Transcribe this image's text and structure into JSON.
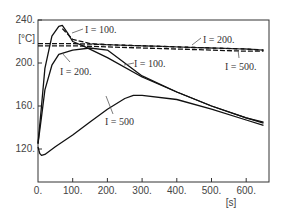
{
  "chart_data": {
    "type": "line",
    "title": "",
    "xlabel": "[s]",
    "ylabel": "[°C]",
    "xlim": [
      0,
      665
    ],
    "ylim": [
      108,
      240
    ],
    "x_ticks": [
      "0.",
      "100.",
      "200.",
      "300.",
      "400.",
      "500.",
      "600."
    ],
    "y_ticks": [
      "240.",
      "200.",
      "160.",
      "120."
    ],
    "grid": false,
    "legend": "inline annotations",
    "series": [
      {
        "name": "I = 100.",
        "style": "solid",
        "x": [
          0,
          10,
          20,
          40,
          60,
          70,
          85,
          100,
          130,
          200,
          300,
          400,
          500,
          600,
          650
        ],
        "y": [
          125,
          160,
          195,
          225,
          234,
          235,
          228,
          220,
          216,
          205,
          187,
          173,
          160,
          149,
          145
        ]
      },
      {
        "name": "I = 200.",
        "style": "solid",
        "x": [
          0,
          10,
          20,
          40,
          60,
          100,
          150,
          200,
          300,
          400,
          500,
          600,
          650
        ],
        "y": [
          125,
          150,
          175,
          198,
          208,
          212,
          214,
          212,
          188,
          173,
          160,
          149,
          144
        ]
      },
      {
        "name": "I = 500",
        "style": "solid",
        "x": [
          0,
          5,
          10,
          20,
          50,
          100,
          150,
          200,
          250,
          275,
          300,
          400,
          500,
          600,
          650
        ],
        "y": [
          122,
          116,
          114,
          115,
          122,
          133,
          145,
          157,
          167,
          170,
          170,
          166,
          157,
          147,
          142
        ]
      },
      {
        "name": "I = 100. (dashed)",
        "style": "dashed",
        "x": [
          70,
          100,
          150,
          200,
          300,
          400,
          500,
          600,
          650
        ],
        "y": [
          232,
          222,
          218,
          217,
          216,
          215,
          214,
          213,
          212
        ]
      },
      {
        "name": "I = 200. (dashed)",
        "style": "dashed",
        "x": [
          0,
          100,
          200,
          300,
          400,
          500,
          600,
          650
        ],
        "y": [
          218,
          218,
          217,
          216,
          215,
          214,
          213,
          212
        ]
      },
      {
        "name": "I = 500. (dashed)",
        "style": "dashed",
        "x": [
          0,
          100,
          200,
          300,
          400,
          500,
          600,
          650
        ],
        "y": [
          216,
          216,
          215,
          214,
          213,
          212,
          211,
          211
        ]
      }
    ],
    "annotations": [
      {
        "text": "I  =  100.",
        "near_x": 110,
        "near_y": 232
      },
      {
        "text": "I  =  200.",
        "near_x": 60,
        "near_y": 203
      },
      {
        "text": "I  =  100.",
        "near_x": 300,
        "near_y": 208
      },
      {
        "text": "I  =  200.",
        "near_x": 480,
        "near_y": 222
      },
      {
        "text": "I  =  500.",
        "near_x": 560,
        "near_y": 205
      },
      {
        "text": "I  =  500",
        "near_x": 250,
        "near_y": 148
      }
    ]
  },
  "labels": {
    "y_unit": "[°C]",
    "x_unit": "[s]",
    "ann_100_top": "I  =  100.",
    "ann_200_left": "I  =  200.",
    "ann_100_mid": "I  =  100.",
    "ann_200_right": "I  =  200.",
    "ann_500_right": "I  =  500.",
    "ann_500_low": "I  =  500",
    "y240": "240.",
    "y200": "200.",
    "y160": "160.",
    "y120": "120.",
    "x0": "0.",
    "x100": "100.",
    "x200": "200.",
    "x300": "300.",
    "x400": "400.",
    "x500": "500.",
    "x600": "600."
  }
}
